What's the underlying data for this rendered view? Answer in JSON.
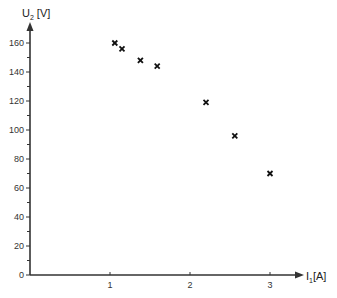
{
  "chart_data": {
    "type": "scatter",
    "title": "",
    "xlabel": "I1[A]",
    "xlabel_main": "I",
    "xlabel_sub": "1",
    "xlabel_unit": "[A]",
    "ylabel": "U2 [V]",
    "ylabel_main": "U",
    "ylabel_sub": "2",
    "ylabel_unit": "[V]",
    "xlim": [
      0,
      3.3
    ],
    "ylim": [
      0,
      170
    ],
    "x_ticks": [
      1,
      2,
      3
    ],
    "x_tick_labels": [
      "1",
      "2",
      "3"
    ],
    "y_ticks": [
      0,
      20,
      40,
      60,
      80,
      100,
      120,
      140,
      160
    ],
    "y_tick_labels": [
      "0",
      "20",
      "40",
      "60",
      "80",
      "100",
      "120",
      "140",
      "160"
    ],
    "y_minor_ticks": [
      10,
      30,
      50,
      70,
      90,
      110,
      130,
      150
    ],
    "grid": false,
    "legend": null,
    "marker": "×",
    "series": [
      {
        "name": "U2 vs I1",
        "points": [
          {
            "x": 1.06,
            "y": 160
          },
          {
            "x": 1.15,
            "y": 156
          },
          {
            "x": 1.38,
            "y": 148
          },
          {
            "x": 1.59,
            "y": 144
          },
          {
            "x": 2.2,
            "y": 119
          },
          {
            "x": 2.56,
            "y": 96
          },
          {
            "x": 3.0,
            "y": 70
          }
        ]
      }
    ]
  },
  "colors": {
    "axis": "#333333",
    "marker": "#111111"
  }
}
